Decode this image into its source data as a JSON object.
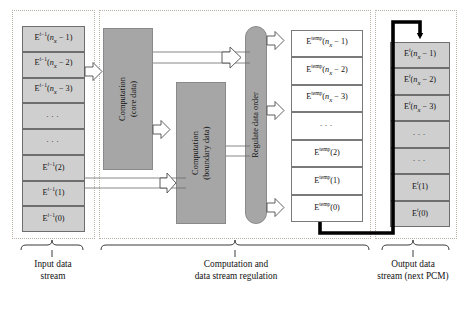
{
  "figure": {
    "colors": {
      "cell_grey": "#cfcfcf",
      "block_grey": "#a6a6a6",
      "cell_white": "#ffffff",
      "dotted_border": "#b9b2a8",
      "feedback_line": "#000000"
    }
  },
  "input_stream": {
    "label": "input-data-stream",
    "cells": [
      {
        "html": "E<sup><i>t</i>&#8722;1</sup>(<i>n<sub>x</sub></i> &#8722; 1)",
        "text": "E^{t-1}(n_x - 1)"
      },
      {
        "html": "E<sup><i>t</i>&#8722;1</sup>(<i>n<sub>x</sub></i> &#8722; 2)",
        "text": "E^{t-1}(n_x - 2)"
      },
      {
        "html": "E<sup><i>t</i>&#8722;1</sup>(<i>n<sub>x</sub></i> &#8722; 3)",
        "text": "E^{t-1}(n_x - 3)"
      },
      {
        "html": "&#183;&#183;&#183;",
        "text": "..."
      },
      {
        "html": "&#183;&#183;&#183;",
        "text": "..."
      },
      {
        "html": "E<sup><i>t</i>&#8722;1</sup>(2)",
        "text": "E^{t-1}(2)"
      },
      {
        "html": "E<sup><i>t</i>&#8722;1</sup>(1)",
        "text": "E^{t-1}(1)"
      },
      {
        "html": "E<sup><i>t</i>&#8722;1</sup>(0)",
        "text": "E^{t-1}(0)"
      }
    ]
  },
  "blocks": {
    "core": {
      "line1": "Computation",
      "line2": "(core data)"
    },
    "boundary": {
      "line1": "Computation",
      "line2": "(boundary data)"
    },
    "regulate": {
      "line1": "Regulate data order"
    }
  },
  "temp_stream": {
    "label": "temporary-data-stream",
    "cells": [
      {
        "html": "E<sup>temp</sup>(<i>n<sub>x</sub></i> &#8722; 1)",
        "text": "E^temp(n_x - 1)"
      },
      {
        "html": "E<sup>temp</sup>(<i>n<sub>x</sub></i> &#8722; 2)",
        "text": "E^temp(n_x - 2)"
      },
      {
        "html": "E<sup>temp</sup>(<i>n<sub>x</sub></i> &#8722; 3)",
        "text": "E^temp(n_x - 3)"
      },
      {
        "html": "&#183;&#183;&#183;",
        "text": "..."
      },
      {
        "html": "E<sup>temp</sup>(2)",
        "text": "E^temp(2)"
      },
      {
        "html": "E<sup>temp</sup>(1)",
        "text": "E^temp(1)"
      },
      {
        "html": "E<sup>temp</sup>(0)",
        "text": "E^temp(0)"
      }
    ]
  },
  "output_stream": {
    "label": "output-data-stream",
    "cells": [
      {
        "html": "E<sup><i>t</i></sup>(<i>n<sub>x</sub></i> &#8722; 1)",
        "text": "E^t(n_x - 1)"
      },
      {
        "html": "E<sup><i>t</i></sup>(<i>n<sub>x</sub></i> &#8722; 2)",
        "text": "E^t(n_x - 2)"
      },
      {
        "html": "E<sup><i>t</i></sup>(<i>n<sub>x</sub></i> &#8722; 3)",
        "text": "E^t(n_x - 3)"
      },
      {
        "html": "&#183;&#183;&#183;",
        "text": "..."
      },
      {
        "html": "&#183;&#183;&#183;",
        "text": "..."
      },
      {
        "html": "E<sup><i>t</i></sup>(1)",
        "text": "E^t(1)"
      },
      {
        "html": "E<sup><i>t</i></sup>(0)",
        "text": "E^t(0)"
      }
    ]
  },
  "captions": [
    {
      "id": "input",
      "line1": "Input data",
      "line2": "stream"
    },
    {
      "id": "computation",
      "line1": "Computation and",
      "line2": "data stream regulation"
    },
    {
      "id": "output",
      "line1": "Output data",
      "line2": "stream (next PCM)"
    }
  ]
}
